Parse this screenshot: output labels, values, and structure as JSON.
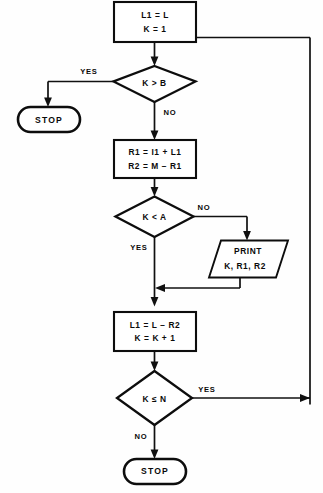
{
  "diagram": {
    "type": "flowchart",
    "colors": {
      "background": "#fefefe",
      "stroke": "#0d0d0d",
      "text": "#0a0a0a",
      "shape_fill": "#ffffff"
    },
    "nodes": {
      "init": {
        "shape": "process",
        "line1": "L1 = L",
        "line2": "K = 1"
      },
      "decision_k_gt_b": {
        "shape": "decision",
        "label": "K > B"
      },
      "stop_top": {
        "shape": "terminal",
        "label": "STOP"
      },
      "compute_r": {
        "shape": "process",
        "line1": "R1 = I1 + L1",
        "line2": "R2 = M − R1"
      },
      "decision_k_lt_a": {
        "shape": "decision",
        "label": "K < A"
      },
      "print_io": {
        "shape": "input-output",
        "line1": "PRINT",
        "line2": "K, R1, R2"
      },
      "update": {
        "shape": "process",
        "line1": "L1 = L − R2",
        "line2": "K = K + 1"
      },
      "decision_k_le_n": {
        "shape": "decision",
        "label": "K ≤ N"
      },
      "stop_bottom": {
        "shape": "terminal",
        "label": "STOP"
      }
    },
    "branch_labels": {
      "k_gt_b_yes": "YES",
      "k_gt_b_no": "NO",
      "k_lt_a_no": "NO",
      "k_lt_a_yes": "YES",
      "k_le_n_yes": "YES",
      "k_le_n_no": "NO"
    }
  }
}
